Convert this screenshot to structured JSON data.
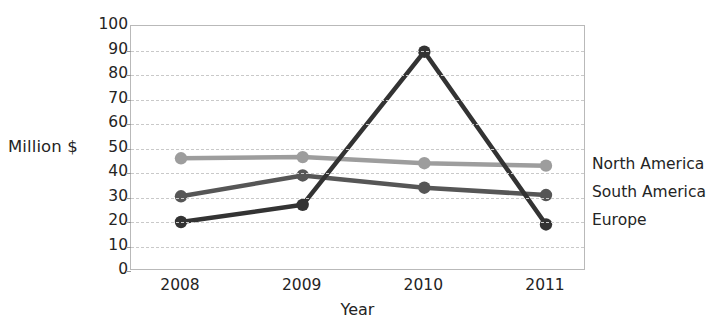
{
  "chart_data": {
    "type": "line",
    "title": "",
    "xlabel": "Year",
    "ylabel": "Million $",
    "categories": [
      "2008",
      "2009",
      "2010",
      "2011"
    ],
    "ylim": [
      0,
      100
    ],
    "ytick_step": 10,
    "yticks": [
      "100",
      "90",
      "80",
      "70",
      "60",
      "50",
      "40",
      "30",
      "20",
      "10",
      "0"
    ],
    "grid": "horizontal-dashed",
    "legend_position": "right",
    "series": [
      {
        "name": "North America",
        "color": "#9d9d9d",
        "values": [
          46,
          46.5,
          44,
          43
        ]
      },
      {
        "name": "South America",
        "color": "#565656",
        "values": [
          30.5,
          39,
          34,
          31
        ]
      },
      {
        "name": "Europe",
        "color": "#333333",
        "values": [
          20,
          27,
          89.5,
          19
        ]
      }
    ]
  },
  "axes": {
    "y_title": "Million $",
    "x_title": "Year"
  },
  "legend": {
    "items": [
      {
        "label": "North America"
      },
      {
        "label": "South America"
      },
      {
        "label": "Europe"
      }
    ]
  },
  "colors": {
    "north_america": "#9d9d9d",
    "south_america": "#565656",
    "europe": "#333333",
    "gridline": "#c9c9c9",
    "frame": "#b9b9b9",
    "text": "#242424"
  },
  "ghost_title": ""
}
